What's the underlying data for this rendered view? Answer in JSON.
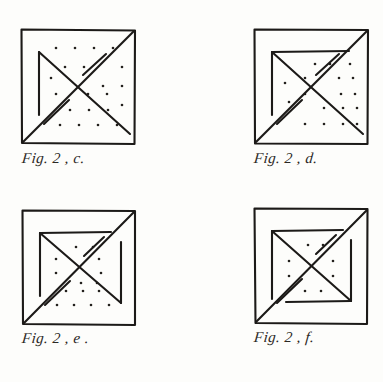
{
  "page": {
    "background_color": "#fdfdfb",
    "ink_color": "#1c1a18",
    "width": 383,
    "height": 382
  },
  "figures": [
    {
      "id": "fig-2-c",
      "caption": "Fig. 2 , c.",
      "position": {
        "x": 20,
        "y": 28
      },
      "square": {
        "size": 114
      },
      "elements": {
        "outer_square": true,
        "main_diagonal": "bottom-left to top-right",
        "broken_diagonal": "top-left area to bottom-right",
        "inner_vertical_left": true,
        "inner_horizontal_top": false,
        "inner_vertical_right": false,
        "inner_horizontal_bottom": false
      },
      "dot_grid": {
        "columns": 5,
        "rows": 5,
        "spacing": 19,
        "visible_dots": 19
      }
    },
    {
      "id": "fig-2-d",
      "caption": "Fig. 2 , d.",
      "position": {
        "x": 253,
        "y": 28
      },
      "square": {
        "size": 114
      },
      "elements": {
        "outer_square": true,
        "main_diagonal": "bottom-left to top-right",
        "broken_diagonal": "top-left area to bottom-right",
        "inner_vertical_left": true,
        "inner_horizontal_top": true,
        "inner_vertical_right": false,
        "inner_horizontal_bottom": false
      },
      "dot_grid": {
        "columns": 5,
        "rows": 5,
        "spacing": 19,
        "visible_dots": 16
      }
    },
    {
      "id": "fig-2-e",
      "caption": "Fig. 2 , e .",
      "position": {
        "x": 21,
        "y": 209
      },
      "square": {
        "size": 114
      },
      "elements": {
        "outer_square": true,
        "main_diagonal": "bottom-left to top-right",
        "broken_diagonal": "top-left area to bottom-right",
        "inner_vertical_left": true,
        "inner_horizontal_top": true,
        "inner_vertical_right": true,
        "inner_horizontal_bottom": false
      },
      "dot_grid": {
        "columns": 5,
        "rows": 5,
        "spacing": 19,
        "visible_dots": 14
      }
    },
    {
      "id": "fig-2-f",
      "caption": "Fig. 2 , f.",
      "position": {
        "x": 253,
        "y": 207
      },
      "square": {
        "size": 114
      },
      "elements": {
        "outer_square": true,
        "main_diagonal": "bottom-left to top-right",
        "broken_diagonal": "top-left area to bottom-right",
        "inner_vertical_left": true,
        "inner_horizontal_top": true,
        "inner_vertical_right": true,
        "inner_horizontal_bottom": true
      },
      "dot_grid": {
        "columns": 5,
        "rows": 5,
        "spacing": 19,
        "visible_dots": 10
      }
    }
  ],
  "captions": {
    "c": "Fig. 2 , c.",
    "d": "Fig. 2 , d.",
    "e": "Fig. 2 , e .",
    "f": "Fig. 2 , f."
  },
  "caption_positions": {
    "c": {
      "x": 22,
      "y": 158
    },
    "d": {
      "x": 254,
      "y": 158
    },
    "e": {
      "x": 22,
      "y": 338
    },
    "f": {
      "x": 254,
      "y": 337
    }
  }
}
